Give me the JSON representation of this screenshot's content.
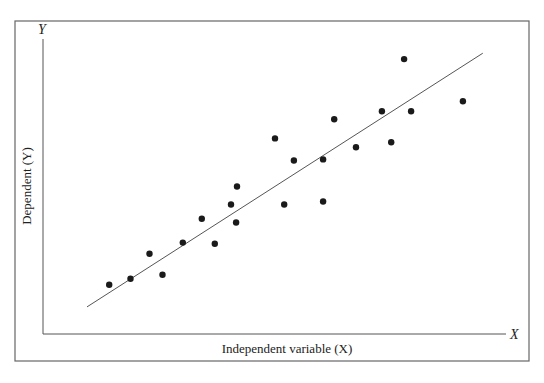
{
  "chart_data": {
    "type": "scatter",
    "title": "",
    "xlabel": "Independent variable (X)",
    "ylabel": "Dependent (Y)",
    "x_axis_letter": "X",
    "y_axis_letter": "Y",
    "grid": false,
    "ticks": false,
    "legend": null,
    "xlim": [
      0,
      100
    ],
    "ylim": [
      0,
      100
    ],
    "points": [
      {
        "x": 14.3,
        "y": 16.7
      },
      {
        "x": 18.9,
        "y": 18.7
      },
      {
        "x": 23.0,
        "y": 27.2
      },
      {
        "x": 25.8,
        "y": 20.1
      },
      {
        "x": 30.2,
        "y": 31.0
      },
      {
        "x": 34.3,
        "y": 39.1
      },
      {
        "x": 37.1,
        "y": 30.6
      },
      {
        "x": 40.6,
        "y": 43.9
      },
      {
        "x": 41.7,
        "y": 37.8
      },
      {
        "x": 41.9,
        "y": 50.0
      },
      {
        "x": 50.1,
        "y": 66.3
      },
      {
        "x": 52.1,
        "y": 43.9
      },
      {
        "x": 54.2,
        "y": 58.8
      },
      {
        "x": 60.5,
        "y": 59.2
      },
      {
        "x": 60.5,
        "y": 44.9
      },
      {
        "x": 62.9,
        "y": 72.8
      },
      {
        "x": 67.6,
        "y": 63.3
      },
      {
        "x": 73.2,
        "y": 75.5
      },
      {
        "x": 75.2,
        "y": 65.0
      },
      {
        "x": 78.0,
        "y": 93.2
      },
      {
        "x": 79.5,
        "y": 75.5
      },
      {
        "x": 90.7,
        "y": 78.9
      }
    ],
    "regression_line": {
      "x0": 9.5,
      "y0": 9.2,
      "x1": 95.0,
      "y1": 95.2
    },
    "annotations": []
  },
  "plot_px": {
    "frame": {
      "x": 15,
      "y": 21,
      "w": 514,
      "h": 340
    },
    "origin": {
      "x": 43,
      "y": 334
    },
    "y_axis_top": 39,
    "x_axis_right": 506,
    "x_scale_px": 463,
    "y_scale_px": 295,
    "dot_radius": 3.2,
    "stroke_color": "#555555",
    "dot_color": "#1a1a1a"
  }
}
